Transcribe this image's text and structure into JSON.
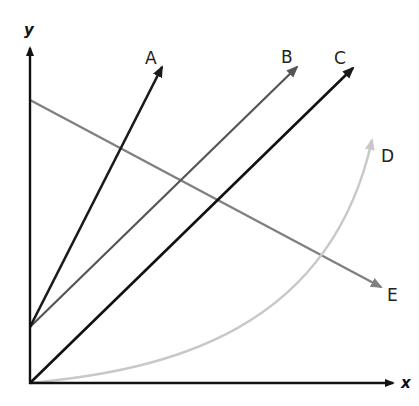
{
  "diagram": {
    "axes": {
      "x_label": "x",
      "y_label": "y",
      "color": "#111111"
    },
    "lines": [
      {
        "id": "A",
        "label": "A",
        "color": "#1a1a1a",
        "type": "straight",
        "from": "y-intercept (positive)",
        "description": "steep positive slope"
      },
      {
        "id": "B",
        "label": "B",
        "color": "#555555",
        "type": "straight",
        "from": "y-intercept (positive)",
        "description": "moderate positive slope"
      },
      {
        "id": "C",
        "label": "C",
        "color": "#111111",
        "type": "straight",
        "from": "origin",
        "description": "positive slope through origin"
      },
      {
        "id": "D",
        "label": "D",
        "color": "#c8c8c8",
        "type": "curve",
        "from": "origin",
        "description": "increasing curve (exponential-like)"
      },
      {
        "id": "E",
        "label": "E",
        "color": "#808080",
        "type": "straight",
        "from": "y-intercept (high)",
        "description": "negative slope"
      }
    ]
  }
}
